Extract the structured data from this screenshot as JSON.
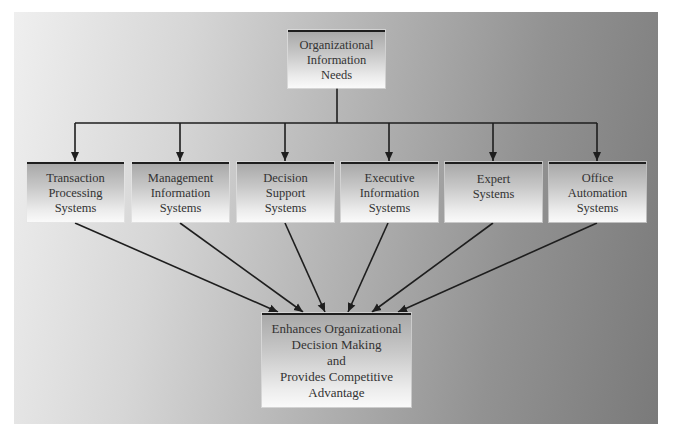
{
  "diagram": {
    "top_node": {
      "lines": [
        "Organizational",
        "Information",
        "Needs"
      ]
    },
    "middle_nodes": [
      {
        "lines": [
          "Transaction",
          "Processing",
          "Systems"
        ]
      },
      {
        "lines": [
          "Management",
          "Information",
          "Systems"
        ]
      },
      {
        "lines": [
          "Decision",
          "Support",
          "Systems"
        ]
      },
      {
        "lines": [
          "Executive",
          "Information",
          "Systems"
        ]
      },
      {
        "lines": [
          "Expert",
          "Systems"
        ]
      },
      {
        "lines": [
          "Office",
          "Automation",
          "Systems"
        ]
      }
    ],
    "bottom_node": {
      "lines": [
        "Enhances Organizational",
        "Decision Making",
        "and",
        "Provides Competitive",
        "Advantage"
      ]
    },
    "colors": {
      "line": "#1e1e1e",
      "text": "#333333",
      "panel_left": "#efefef",
      "panel_right": "#7a7a7a"
    }
  }
}
